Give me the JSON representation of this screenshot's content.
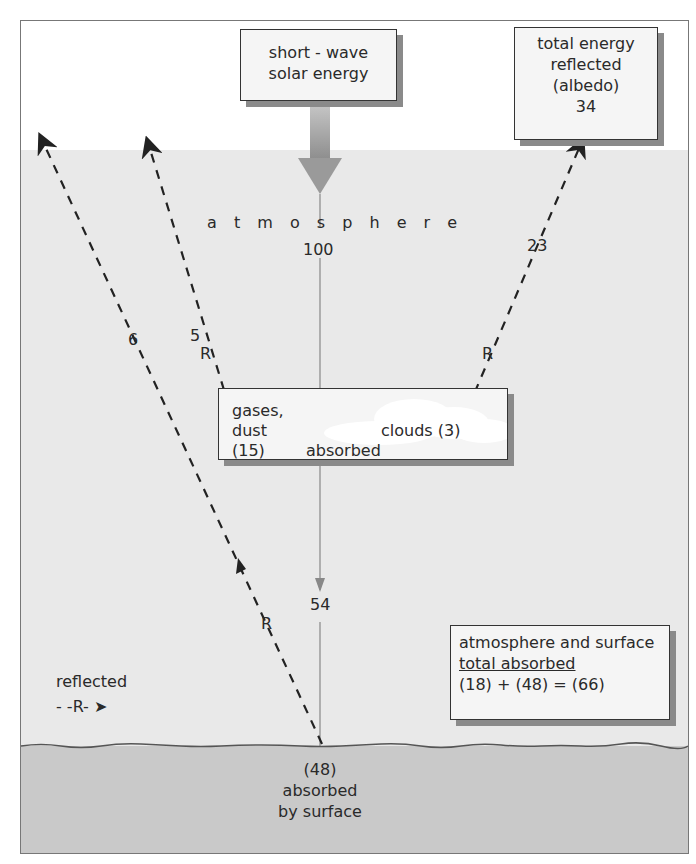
{
  "diagram": {
    "solar_box": {
      "line1": "short - wave",
      "line2": "solar energy"
    },
    "albedo_box": {
      "line1": "total energy",
      "line2": "reflected",
      "line3": "(albedo)",
      "line4": "34"
    },
    "atmosphere_label": "a t m o s p h e r e",
    "incoming_value": "100",
    "left_arrow_outer": {
      "value": "6"
    },
    "left_arrow_inner": {
      "value": "5",
      "marker": "R"
    },
    "right_arrow": {
      "value": "23",
      "marker": "R"
    },
    "absorbed_box": {
      "gases_line1": "gases,",
      "gases_line2": "dust",
      "gases_value": "(15)",
      "clouds": "clouds (3)",
      "absorbed": "absorbed"
    },
    "transmitted_value": "54",
    "surface_reflect_marker": "R",
    "legend": {
      "label": "reflected",
      "symbol": "- -R- ➤"
    },
    "summary_box": {
      "line1": "atmosphere and surface",
      "line2": "total absorbed",
      "line3": "(18) + (48) = (66)"
    },
    "surface": {
      "value": "(48)",
      "line1": "absorbed",
      "line2": "by surface"
    },
    "colors": {
      "atmosphere": "#e9e9e9",
      "ground": "#c9c9c9",
      "box_bg": "#f5f5f5",
      "arrow": "#9a9a9a"
    }
  }
}
